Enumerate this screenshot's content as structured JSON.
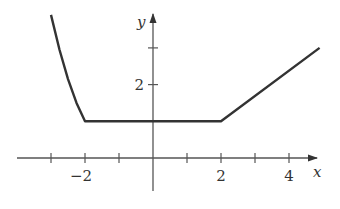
{
  "chart_data": {
    "type": "line",
    "title": "",
    "xlabel": "x",
    "ylabel": "y",
    "xlim": [
      -4,
      5
    ],
    "ylim": [
      -1.4,
      4
    ],
    "x_ticks": [
      -3,
      -2,
      -1,
      0,
      1,
      2,
      3,
      4
    ],
    "x_tick_labels": [
      {
        "value": -2,
        "label": "−2"
      },
      {
        "value": 2,
        "label": "2"
      },
      {
        "value": 4,
        "label": "4"
      }
    ],
    "y_ticks": [
      1,
      2,
      3
    ],
    "y_tick_labels": [
      {
        "value": 2,
        "label": "2"
      }
    ],
    "grid": false,
    "legend": null,
    "series": [
      {
        "name": "f(x)",
        "description": "Decreasing curve for x < -2, constant 1 on [-2, 2], linear increase with slope 1 for x > 2",
        "points": [
          {
            "x": -3.0,
            "y": 3.9
          },
          {
            "x": -2.75,
            "y": 2.95
          },
          {
            "x": -2.5,
            "y": 2.15
          },
          {
            "x": -2.25,
            "y": 1.5
          },
          {
            "x": -2.0,
            "y": 1.0
          },
          {
            "x": 2.0,
            "y": 1.0
          },
          {
            "x": 4.9,
            "y": 3.0
          }
        ]
      }
    ],
    "color": "#333333"
  }
}
